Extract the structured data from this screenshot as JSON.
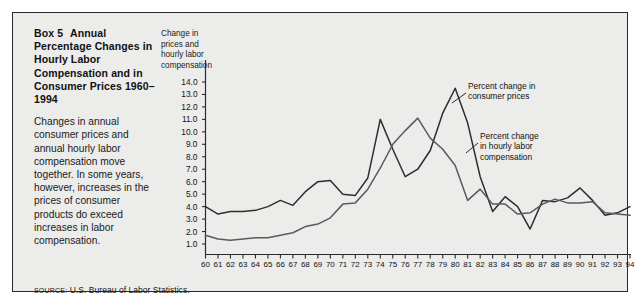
{
  "box": {
    "title_label": "Box 5",
    "title_rest": "Annual Percentage Changes in Hourly Labor Compensation and in Consumer Prices 1960–1994",
    "description": "Changes in annual consumer prices and annual hourly labor compensation move together. In some years, however, increases in the prices of consumer products do exceed increases in labor compensation.",
    "source_label": "SOURCE:",
    "source_text": "U.S. Bureau of Labor Statistics."
  },
  "chart_data": {
    "type": "line",
    "title": "",
    "xlabel": "",
    "ylabel": "Change in prices and hourly labor compensation",
    "axis_caption": "Change in prices and hourly labor compensation",
    "xlim": [
      60,
      94
    ],
    "ylim": [
      0.4,
      14.6
    ],
    "grid": false,
    "legend_position": "inline-annotations",
    "ytick_labels": [
      "14.0",
      "13.0",
      "12.0",
      "11.0",
      "10.0",
      "9.0",
      "8.0",
      "7.0",
      "6.0",
      "5.0",
      "4.0",
      "3.0",
      "2.0",
      "1.0"
    ],
    "yticks": [
      14,
      13,
      12,
      11,
      10,
      9,
      8,
      7,
      6,
      5,
      4,
      3,
      2,
      1
    ],
    "categories": [
      "60",
      "61",
      "62",
      "63",
      "64",
      "65",
      "66",
      "67",
      "68",
      "69",
      "70",
      "71",
      "72",
      "73",
      "74",
      "75",
      "76",
      "77",
      "78",
      "79",
      "80",
      "81",
      "82",
      "83",
      "84",
      "85",
      "86",
      "87",
      "88",
      "89",
      "90",
      "91",
      "92",
      "93",
      "94"
    ],
    "series": [
      {
        "name": "Percent change in consumer prices",
        "color": "#2e2e2e",
        "values": [
          4.0,
          3.4,
          3.6,
          3.6,
          3.7,
          4.0,
          4.5,
          4.1,
          5.2,
          6.0,
          6.1,
          5.0,
          4.9,
          6.3,
          11.0,
          8.6,
          6.4,
          7.0,
          8.5,
          11.5,
          13.5,
          10.7,
          6.4,
          3.6,
          4.8,
          4.0,
          2.2,
          4.5,
          4.4,
          4.7,
          5.5,
          4.5,
          3.3,
          3.5,
          4.0
        ],
        "annotation": "Percent change in consumer prices"
      },
      {
        "name": "Percent change in hourly labor compensation",
        "color": "#5a5a5a",
        "values": [
          1.7,
          1.4,
          1.3,
          1.4,
          1.5,
          1.5,
          1.7,
          1.9,
          2.4,
          2.6,
          3.1,
          4.2,
          4.3,
          5.4,
          7.1,
          9.0,
          10.1,
          11.1,
          9.5,
          8.6,
          7.3,
          4.5,
          5.4,
          4.2,
          4.2,
          3.4,
          3.5,
          4.2,
          4.6,
          4.3,
          4.3,
          4.4,
          3.5,
          3.4,
          3.3
        ],
        "annotation": "Percent change in hourly labor compensation"
      }
    ],
    "annotations": [
      {
        "id": "cpi",
        "text_line1": "Percent change in",
        "text_line2": "consumer prices"
      },
      {
        "id": "comp",
        "text_line1": "Percent change",
        "text_line2": "in hourly labor",
        "text_line3": "compensation"
      }
    ]
  }
}
